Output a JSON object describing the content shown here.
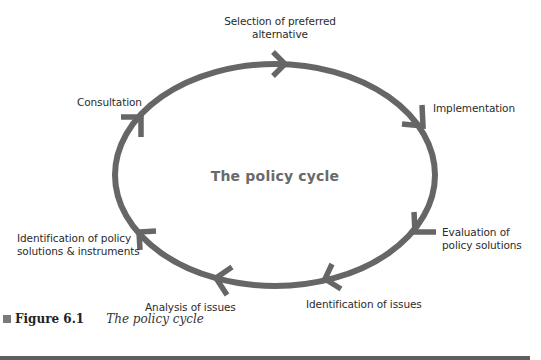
{
  "diagram": {
    "center_title": "The policy cycle",
    "stroke_color": "#666666",
    "stages": [
      {
        "id": "selection",
        "label_line1": "Selection of preferred",
        "label_line2": "alternative"
      },
      {
        "id": "implementation",
        "label_line1": "Implementation"
      },
      {
        "id": "evaluation",
        "label_line1": "Evaluation of",
        "label_line2": "policy solutions"
      },
      {
        "id": "identification-issues",
        "label_line1": "Identification of issues"
      },
      {
        "id": "analysis",
        "label_line1": "Analysis of issues"
      },
      {
        "id": "identification-solutions",
        "label_line1": "Identification of policy",
        "label_line2": "solutions & instruments"
      },
      {
        "id": "consultation",
        "label_line1": "Consultation"
      }
    ]
  },
  "caption": {
    "figure_number": "Figure 6.1",
    "figure_title": "The policy cycle"
  }
}
